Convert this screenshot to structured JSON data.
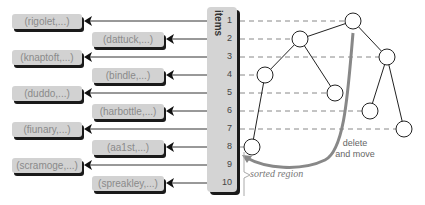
{
  "column": {
    "label": "items",
    "indices": [
      "1",
      "2",
      "3",
      "4",
      "5",
      "6",
      "7",
      "8",
      "9",
      "10"
    ]
  },
  "records": [
    {
      "label": "(rigolet,...)"
    },
    {
      "label": "(dattuck,...)"
    },
    {
      "label": "(knaptoft,...)"
    },
    {
      "label": "(bindle,...)"
    },
    {
      "label": "(duddo,...)"
    },
    {
      "label": "(harbottle,...)"
    },
    {
      "label": "(fiunary,...)"
    },
    {
      "label": "(aa1st,...)"
    },
    {
      "label": "(scramoge,...)"
    },
    {
      "label": "(spreakley,...)"
    }
  ],
  "annotations": {
    "delete_move_line1": "delete",
    "delete_move_line2": "and move",
    "sorted_region": "sorted region"
  },
  "colors": {
    "record_fill": "#d2d2d2",
    "shadow": "#1a1a1a",
    "arrow": "#888888"
  }
}
